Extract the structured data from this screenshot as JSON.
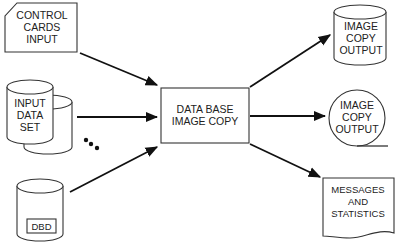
{
  "diagram": {
    "nodes": [
      {
        "id": "control-cards",
        "shape": "punched-card",
        "lines": [
          "CONTROL",
          "CARDS",
          "INPUT"
        ]
      },
      {
        "id": "input-data-set",
        "shape": "stacked-disk",
        "lines": [
          "INPUT",
          "DATA",
          "SET"
        ]
      },
      {
        "id": "dbd",
        "shape": "disk-with-label",
        "lines": [
          "DBD"
        ]
      },
      {
        "id": "image-copy",
        "shape": "process-box",
        "lines": [
          "DATA BASE",
          "IMAGE COPY"
        ]
      },
      {
        "id": "disk-output",
        "shape": "disk",
        "lines": [
          "IMAGE",
          "COPY",
          "OUTPUT"
        ]
      },
      {
        "id": "tape-output",
        "shape": "tape",
        "lines": [
          "IMAGE",
          "COPY",
          "OUTPUT"
        ]
      },
      {
        "id": "messages",
        "shape": "document",
        "lines": [
          "MESSAGES",
          "AND",
          "STATISTICS"
        ]
      }
    ],
    "edges": [
      {
        "from": "control-cards",
        "to": "image-copy"
      },
      {
        "from": "input-data-set",
        "to": "image-copy"
      },
      {
        "from": "dbd",
        "to": "image-copy"
      },
      {
        "from": "image-copy",
        "to": "disk-output"
      },
      {
        "from": "image-copy",
        "to": "tape-output"
      },
      {
        "from": "image-copy",
        "to": "messages"
      }
    ],
    "ellipsis_note": "more input data sets (three dots)"
  }
}
